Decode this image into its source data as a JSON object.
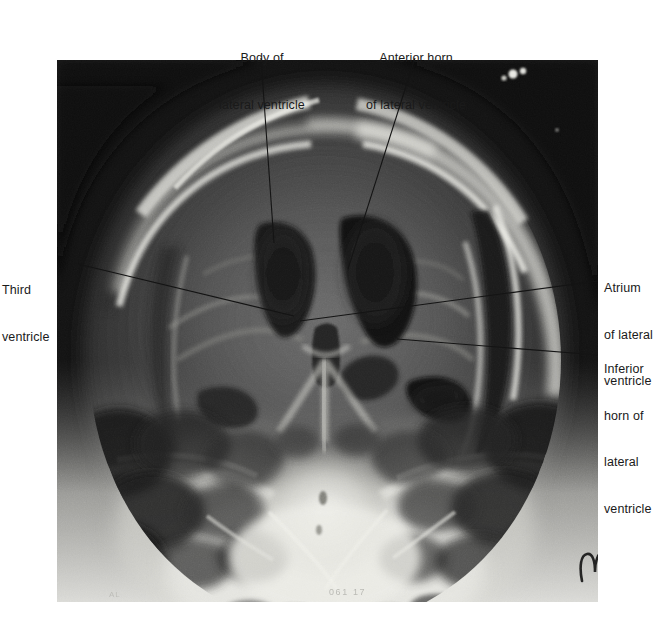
{
  "figure": {
    "type": "annotated-radiograph",
    "modality": "pneumoencephalogram",
    "view": "frontal (AP) skull",
    "width": 659,
    "height": 620,
    "background_color": "#ffffff"
  },
  "radiograph": {
    "name": "skull-radiograph",
    "x": 57,
    "y": 60,
    "width": 541,
    "height": 542,
    "film_marker": "ms",
    "edge_text": "061  17"
  },
  "labels": [
    {
      "id": "body-of-lateral-ventricle",
      "line1": "Body of",
      "line2": "lateral ventricle",
      "align": "center",
      "leader": {
        "x1": 261,
        "y1": 58,
        "x2": 274,
        "y2": 243
      }
    },
    {
      "id": "anterior-horn-of-lateral-ventricle",
      "line1": "Anterior horn",
      "line2": "of lateral ventricle",
      "align": "center",
      "leader": {
        "x1": 415,
        "y1": 58,
        "x2": 348,
        "y2": 269
      }
    },
    {
      "id": "third-ventricle",
      "line1": "Third",
      "line2": "ventricle",
      "align": "left",
      "leader": {
        "x1": 78,
        "y1": 264,
        "x2": 294,
        "y2": 316
      }
    },
    {
      "id": "atrium-of-lateral-ventricle",
      "line1": "Atrium",
      "line2": "of lateral",
      "line3": "ventricle",
      "align": "left",
      "leader": {
        "x1": 598,
        "y1": 281,
        "x2": 300,
        "y2": 321
      }
    },
    {
      "id": "inferior-horn-of-lateral-ventricle",
      "line1": "Inferior",
      "line2": "horn of",
      "line3": "lateral",
      "line4": "ventricle",
      "align": "left",
      "leader": {
        "x1": 598,
        "y1": 355,
        "x2": 397,
        "y2": 339
      }
    }
  ],
  "colors": {
    "page_background": "#ffffff",
    "label_text": "#1a1a1a",
    "leader_line": "#141414",
    "film_dark": "#0d0d0d",
    "film_mid": "#6f6f6f",
    "film_bright": "#e8e8e4",
    "ventricle_air": "#1c1c1c"
  }
}
